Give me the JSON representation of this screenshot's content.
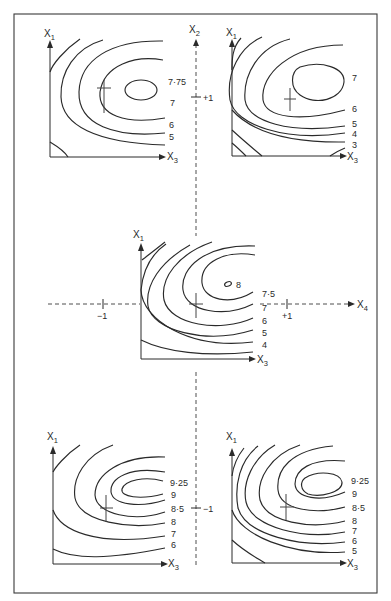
{
  "figure": {
    "frame_color": "#3a3a3a",
    "line_color": "#2a2a2a"
  },
  "axes": {
    "x2": {
      "label": "X",
      "sub": "2",
      "ticks": [
        {
          "label": "+1"
        },
        {
          "label": "−1"
        }
      ]
    },
    "x4": {
      "label": "X",
      "sub": "4",
      "ticks": [
        {
          "label": "−1"
        },
        {
          "label": "+1"
        }
      ]
    }
  },
  "plots": {
    "top_left": {
      "y_label": "X",
      "y_sub": "1",
      "x_label": "X",
      "x_sub": "3",
      "contour_labels": [
        "7·75",
        "7",
        "6",
        "5"
      ]
    },
    "top_right": {
      "y_label": "X",
      "y_sub": "1",
      "x_label": "X",
      "x_sub": "3",
      "contour_labels": [
        "7",
        "6",
        "5",
        "4",
        "3"
      ]
    },
    "center": {
      "y_label": "X",
      "y_sub": "1",
      "x_label": "X",
      "x_sub": "3",
      "contour_labels": [
        "8",
        "7·5",
        "7",
        "6",
        "5",
        "4"
      ]
    },
    "bottom_left": {
      "y_label": "X",
      "y_sub": "1",
      "x_label": "X",
      "x_sub": "3",
      "contour_labels": [
        "9·25",
        "9",
        "8·5",
        "8",
        "7",
        "6"
      ]
    },
    "bottom_right": {
      "y_label": "X",
      "y_sub": "1",
      "x_label": "X",
      "x_sub": "3",
      "contour_labels": [
        "9·25",
        "9",
        "8·5",
        "8",
        "7",
        "6",
        "5"
      ]
    }
  }
}
